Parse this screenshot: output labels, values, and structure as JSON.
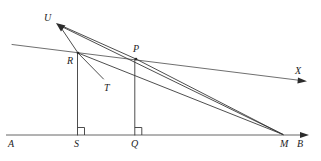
{
  "figure": {
    "kind": "geometry-diagram",
    "canvas": {
      "width": 321,
      "height": 161
    },
    "ink_color": "#3a3a3a",
    "label_color": "#1d1d1d",
    "background": "#ffffff",
    "points": [
      {
        "id": "U",
        "label": "U",
        "x": 56,
        "y": 23.5,
        "label_x": 44,
        "label_y": 13,
        "kind": "ray-tip"
      },
      {
        "id": "R",
        "label": "R",
        "x": 78,
        "y": 53,
        "label_x": 67,
        "label_y": 56,
        "kind": "vertex"
      },
      {
        "id": "P",
        "label": "P",
        "x": 136,
        "y": 59,
        "label_x": 133,
        "label_y": 44,
        "kind": "vertex"
      },
      {
        "id": "T",
        "label": "T",
        "x": 104,
        "y": 80,
        "label_x": 104,
        "label_y": 83,
        "kind": "ray-tip"
      },
      {
        "id": "X",
        "label": "X",
        "x": 305,
        "y": 81,
        "label_x": 295,
        "label_y": 66,
        "kind": "ray-tip"
      },
      {
        "id": "A",
        "label": "A",
        "x": 6,
        "y": 135,
        "label_x": 8,
        "label_y": 139,
        "kind": "baseline-end"
      },
      {
        "id": "S",
        "label": "S",
        "x": 77.5,
        "y": 135,
        "label_x": 74,
        "label_y": 139,
        "kind": "foot"
      },
      {
        "id": "Q",
        "label": "Q",
        "x": 134.8,
        "y": 135,
        "label_x": 131,
        "label_y": 139,
        "kind": "foot"
      },
      {
        "id": "M",
        "label": "M",
        "x": 283,
        "y": 135,
        "label_x": 280,
        "label_y": 139,
        "kind": "vertex"
      },
      {
        "id": "B",
        "label": "B",
        "x": 308,
        "y": 135,
        "label_x": 297,
        "label_y": 139,
        "kind": "ray-tip"
      }
    ],
    "segments": [
      {
        "name": "baseline-AB",
        "from": "A",
        "to": "B",
        "arrow": "end"
      },
      {
        "name": "perpendicular-RS",
        "from": "R",
        "to": "S",
        "arrow": "none"
      },
      {
        "name": "perpendicular-PQ",
        "from": "P",
        "to": "Q",
        "arrow": "none"
      },
      {
        "name": "ray-RU",
        "from": "R",
        "to": "U",
        "arrow": "end"
      },
      {
        "name": "ray-PU",
        "from": "P",
        "to": "U",
        "arrow": "end"
      },
      {
        "name": "ray-MU",
        "from": "M",
        "to": "U",
        "arrow": "end"
      },
      {
        "name": "ray-RT",
        "from": "R",
        "to": "T",
        "arrow": "none"
      },
      {
        "name": "line-RX",
        "from": "R",
        "to": "X",
        "arrow": "end"
      },
      {
        "name": "segment-RM",
        "from": "R",
        "to": "M",
        "arrow": "none"
      },
      {
        "name": "segment-PM",
        "from": "P",
        "to": "M",
        "arrow": "none"
      }
    ],
    "right_angles": [
      {
        "name": "right-angle-at-S",
        "at": "S",
        "size": 7
      },
      {
        "name": "right-angle-at-Q",
        "at": "Q",
        "size": 7
      }
    ]
  }
}
